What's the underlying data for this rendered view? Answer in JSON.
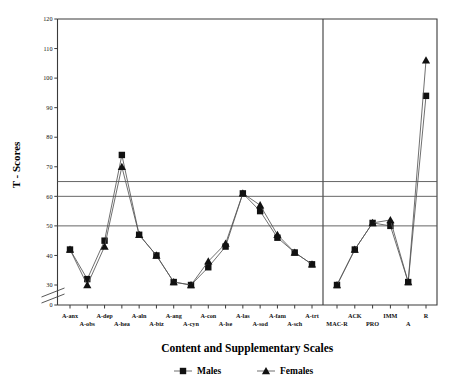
{
  "chart_data": {
    "type": "line",
    "title": "",
    "xlabel": "Content and Supplementary Scales",
    "ylabel": "T - Scores",
    "ylim": [
      0,
      120
    ],
    "y_ticks": [
      0,
      30,
      40,
      50,
      60,
      70,
      80,
      90,
      100,
      110,
      120
    ],
    "y_axis_break": true,
    "grid": false,
    "reference_lines": [
      50,
      60,
      65
    ],
    "legend_position": "bottom",
    "panel_divider_after": "A-trt",
    "categories": [
      "A-anx",
      "A-obs",
      "A-dep",
      "A-hea",
      "A-aln",
      "A-biz",
      "A-ang",
      "A-cyn",
      "A-con",
      "A-lse",
      "A-las",
      "A-sod",
      "A-fam",
      "A-sch",
      "A-trt",
      "MAC-R",
      "ACK",
      "PRO",
      "IMM",
      "A",
      "R"
    ],
    "categories_panel_a": [
      "A-anx",
      "A-obs",
      "A-dep",
      "A-hea",
      "A-aln",
      "A-biz",
      "A-ang",
      "A-cyn",
      "A-con",
      "A-lse",
      "A-las",
      "A-sod",
      "A-fam",
      "A-sch",
      "A-trt"
    ],
    "categories_panel_b": [
      "MAC-R",
      "ACK",
      "PRO",
      "IMM",
      "A",
      "R"
    ],
    "series": [
      {
        "name": "Males",
        "marker": "square",
        "values": [
          42,
          32,
          45,
          74,
          47,
          40,
          31,
          30,
          36,
          43,
          61,
          55,
          46,
          41,
          37,
          30,
          42,
          51,
          50,
          31,
          94
        ]
      },
      {
        "name": "Females",
        "marker": "triangle",
        "values": [
          42,
          30,
          43,
          70,
          47,
          40,
          31,
          30,
          38,
          44,
          61,
          57,
          47,
          41,
          37,
          30,
          42,
          51,
          52,
          31,
          106
        ]
      }
    ],
    "legend": [
      {
        "label": "Males",
        "marker": "square"
      },
      {
        "label": "Females",
        "marker": "triangle"
      }
    ],
    "colors": {
      "line": "#555555",
      "marker": "#111111",
      "axis": "#3a3a3a",
      "reference": "#555555"
    }
  }
}
